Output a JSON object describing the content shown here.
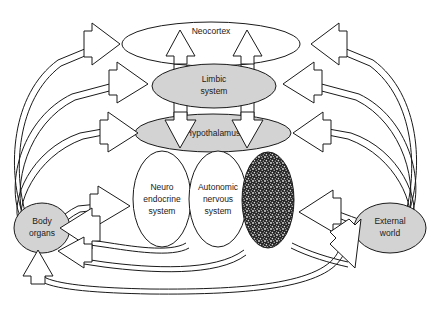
{
  "diagram": {
    "background_color": "#ffffff",
    "line_color": "#1a1a1a",
    "gray_fill": "#d3d3d3",
    "white_fill": "#ffffff",
    "dark_fill": "#2a2a2a",
    "nodes": [
      {
        "id": "neocortex",
        "label": "Neocortex",
        "lines": [
          "Neocortex"
        ],
        "shape": "ellipse",
        "fill": "#ffffff",
        "cx": 211,
        "cy": 44,
        "rx": 89,
        "ry": 22
      },
      {
        "id": "limbic-system",
        "label": "Limbic system",
        "lines": [
          "Limbic",
          "system"
        ],
        "shape": "ellipse",
        "fill": "#d3d3d3",
        "cx": 214,
        "cy": 86,
        "rx": 62,
        "ry": 22
      },
      {
        "id": "hypothalamus",
        "label": "Hypothalamus",
        "lines": [
          "Hypothalamus"
        ],
        "shape": "ellipse",
        "fill": "#d3d3d3",
        "cx": 213,
        "cy": 133,
        "rx": 78,
        "ry": 19
      },
      {
        "id": "neuro-endocrine-system",
        "label": "Neuro endocrine system",
        "lines": [
          "Neuro",
          "endocrine",
          "system"
        ],
        "shape": "ellipse",
        "fill": "#ffffff",
        "cx": 162,
        "cy": 199,
        "rx": 29,
        "ry": 48
      },
      {
        "id": "autonomic-nervous-system",
        "label": "Autonomic nervous system",
        "lines": [
          "Autonomic",
          "nervous",
          "system"
        ],
        "shape": "ellipse",
        "fill": "#ffffff",
        "cx": 218,
        "cy": 199,
        "rx": 29,
        "ry": 48
      },
      {
        "id": "dark-unlabeled-ellipse",
        "label": "",
        "lines": [],
        "shape": "ellipse",
        "fill": "#2a2a2a",
        "cx": 268,
        "cy": 200,
        "rx": 26,
        "ry": 48
      },
      {
        "id": "body-organs",
        "label": "Body organs",
        "lines": [
          "Body",
          "organs"
        ],
        "shape": "ellipse",
        "fill": "#d3d3d3",
        "cx": 42,
        "cy": 228,
        "rx": 28,
        "ry": 25
      },
      {
        "id": "external-world",
        "label": "External world",
        "lines": [
          "External",
          "world"
        ],
        "shape": "ellipse",
        "fill": "#d3d3d3",
        "cx": 390,
        "cy": 228,
        "rx": 36,
        "ry": 25
      }
    ],
    "arrows": [
      {
        "id": "body-to-neocortex",
        "from": "body-organs",
        "to": "neocortex",
        "direction": "right"
      },
      {
        "id": "body-to-limbic",
        "from": "body-organs",
        "to": "limbic-system",
        "direction": "right"
      },
      {
        "id": "body-to-hypothalamus",
        "from": "body-organs",
        "to": "hypothalamus",
        "direction": "right"
      },
      {
        "id": "body-to-neuroendocrine",
        "from": "body-organs",
        "to": "neuro-endocrine-system",
        "direction": "right"
      },
      {
        "id": "world-to-neocortex",
        "from": "external-world",
        "to": "neocortex",
        "direction": "left"
      },
      {
        "id": "world-to-limbic",
        "from": "external-world",
        "to": "limbic-system",
        "direction": "left"
      },
      {
        "id": "world-to-hypothalamus",
        "from": "external-world",
        "to": "hypothalamus",
        "direction": "left"
      },
      {
        "id": "world-to-dark-ellipse",
        "from": "external-world",
        "to": "dark-unlabeled-ellipse",
        "direction": "left"
      },
      {
        "id": "limbic-to-neocortex-left",
        "from": "limbic-system",
        "to": "neocortex",
        "direction": "up"
      },
      {
        "id": "limbic-to-neocortex-right",
        "from": "limbic-system",
        "to": "neocortex",
        "direction": "up"
      },
      {
        "id": "limbic-to-hypothalamus-left",
        "from": "limbic-system",
        "to": "hypothalamus",
        "direction": "down"
      },
      {
        "id": "limbic-to-hypothalamus-right",
        "from": "limbic-system",
        "to": "hypothalamus",
        "direction": "down"
      },
      {
        "id": "systems-to-body-upper",
        "from": "autonomic-nervous-system",
        "to": "body-organs",
        "direction": "left"
      },
      {
        "id": "systems-to-body-lower",
        "from": "autonomic-nervous-system",
        "to": "body-organs",
        "direction": "left"
      },
      {
        "id": "bottom-to-body-organs",
        "from": "dark-unlabeled-ellipse",
        "to": "body-organs",
        "direction": "up"
      },
      {
        "id": "dark-ellipse-to-world",
        "from": "dark-unlabeled-ellipse",
        "to": "external-world",
        "direction": "down-right"
      }
    ]
  }
}
